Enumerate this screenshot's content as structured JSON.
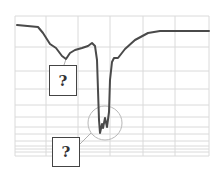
{
  "chart_data": {
    "type": "line",
    "title": "",
    "xlabel": "",
    "ylabel": "",
    "grid": true,
    "y_scale": "log (inverted grid spacing)",
    "legend": null,
    "series": [
      {
        "name": "trace",
        "color": "#4a4a4a",
        "points_px": [
          [
            17,
            25
          ],
          [
            38,
            27
          ],
          [
            43,
            33
          ],
          [
            50,
            44
          ],
          [
            56,
            48
          ],
          [
            62,
            56
          ],
          [
            66,
            59
          ],
          [
            70,
            53
          ],
          [
            75,
            50
          ],
          [
            82,
            48
          ],
          [
            88,
            46
          ],
          [
            92,
            43
          ],
          [
            95,
            46
          ],
          [
            97,
            60
          ],
          [
            98,
            90
          ],
          [
            99,
            120
          ],
          [
            100,
            133
          ],
          [
            102,
            124
          ],
          [
            103,
            128
          ],
          [
            105,
            118
          ],
          [
            107,
            127
          ],
          [
            109,
            112
          ],
          [
            110,
            80
          ],
          [
            112,
            62
          ],
          [
            114,
            58
          ],
          [
            118,
            58
          ],
          [
            125,
            49
          ],
          [
            135,
            40
          ],
          [
            148,
            33
          ],
          [
            160,
            31
          ],
          [
            209,
            31
          ]
        ]
      }
    ],
    "annotations": [
      {
        "type": "box",
        "text": "?",
        "target": "shoulder dip near x≈66"
      },
      {
        "type": "box",
        "text": "?",
        "target": "circled minimum near x≈105"
      }
    ]
  },
  "labels": {
    "upper_box": "?",
    "lower_box": "?"
  },
  "colors": {
    "line": "#4a4a4a",
    "grid": "#d9d9d9",
    "circle": "#b0b0b0"
  }
}
